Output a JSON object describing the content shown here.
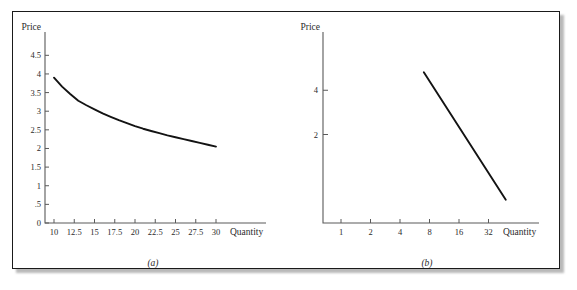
{
  "figure": {
    "background_color": "#ffffff",
    "frame_color": "#1a1a1a",
    "curve_color": "#131313",
    "axis_color": "#5a5a5a"
  },
  "panel_a": {
    "caption": "(a)",
    "x_axis_title": "Quantity",
    "y_axis_title": "Price",
    "x_ticks": [
      "10",
      "12.5",
      "15",
      "17.5",
      "20",
      "22.5",
      "25",
      "27.5",
      "30"
    ],
    "y_ticks": [
      "0",
      ".5",
      "1",
      "1.5",
      "2",
      "2.5",
      "3",
      "3.5",
      "4",
      "4.5"
    ]
  },
  "panel_b": {
    "caption": "(b)",
    "x_axis_title": "Quantity",
    "y_axis_title": "Price",
    "x_ticks": [
      "1",
      "2",
      "4",
      "8",
      "16",
      "32"
    ],
    "y_ticks": [
      "2",
      "4"
    ]
  },
  "chart_data": [
    {
      "type": "line",
      "id": "panel-a-demand-curve",
      "title": "(a)",
      "xlabel": "Quantity",
      "ylabel": "Price",
      "xscale": "linear",
      "yscale": "linear",
      "xlim": [
        10,
        30
      ],
      "ylim": [
        0,
        4.75
      ],
      "xticks": [
        10,
        12.5,
        15,
        17.5,
        20,
        22.5,
        25,
        27.5,
        30
      ],
      "xticklabels": [
        "10",
        "12.5",
        "15",
        "17.5",
        "20",
        "22.5",
        "25",
        "27.5",
        "30"
      ],
      "yticks": [
        0,
        0.5,
        1,
        1.5,
        2,
        2.5,
        3,
        3.5,
        4,
        4.5
      ],
      "yticklabels": [
        "0",
        ".5",
        "1",
        "1.5",
        "2",
        "2.5",
        "3",
        "3.5",
        "4",
        "4.5"
      ],
      "grid": false,
      "legend": false,
      "series": [
        {
          "name": "Demand",
          "x": [
            10,
            11,
            12,
            13,
            14,
            15,
            16,
            17,
            18,
            19,
            20,
            21,
            22,
            23,
            24,
            25,
            26,
            27,
            28,
            29,
            30
          ],
          "y": [
            3.9,
            3.66,
            3.46,
            3.28,
            3.16,
            3.05,
            2.94,
            2.85,
            2.76,
            2.68,
            2.6,
            2.53,
            2.47,
            2.41,
            2.35,
            2.3,
            2.25,
            2.2,
            2.15,
            2.1,
            2.05
          ]
        }
      ]
    },
    {
      "type": "line",
      "id": "panel-b-demand-curve-loglog",
      "title": "(b)",
      "xlabel": "Quantity",
      "ylabel": "Price",
      "xscale": "log2",
      "yscale": "log2",
      "xlim": [
        1,
        64
      ],
      "ylim": [
        0.5,
        8
      ],
      "xticks": [
        1,
        2,
        4,
        8,
        16,
        32
      ],
      "xticklabels": [
        "1",
        "2",
        "4",
        "8",
        "16",
        "32"
      ],
      "yticks": [
        2,
        4
      ],
      "yticklabels": [
        "2",
        "4"
      ],
      "grid": false,
      "legend": false,
      "series": [
        {
          "name": "Demand (log-log)",
          "x": [
            7,
            48
          ],
          "y": [
            5.3,
            0.72
          ]
        }
      ]
    }
  ]
}
